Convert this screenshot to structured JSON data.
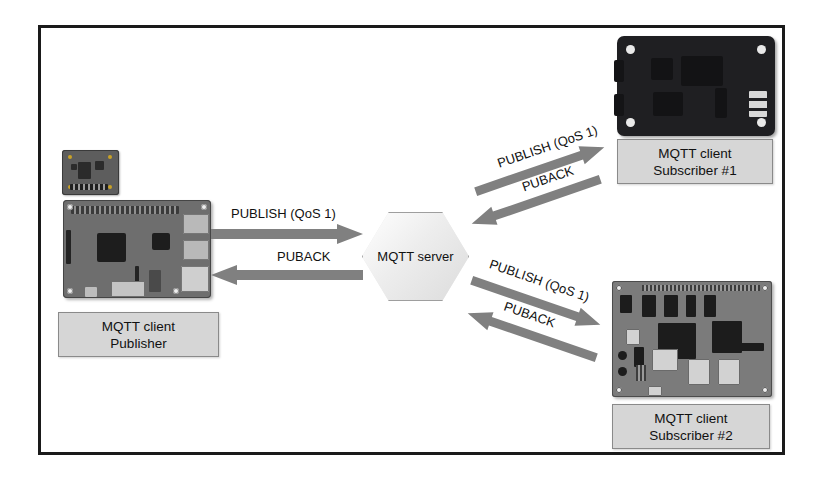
{
  "diagram": {
    "colors": {
      "frame_border": "#1a1a1a",
      "arrow_fill": "#808080",
      "caption_fill": "#d6d6d6",
      "caption_border": "#8a8a8a",
      "hexagon_fill": "#e8e8e8",
      "hexagon_border": "#9e9e9e",
      "background": "#ffffff",
      "text": "#111111"
    },
    "broker": {
      "label": "MQTT server",
      "shape": "hexagon"
    },
    "nodes": [
      {
        "id": "publisher",
        "line1": "MQTT client",
        "line2": "Publisher",
        "device": "raspberry-pi-board",
        "accessory": "sensor-breakout-board"
      },
      {
        "id": "subscriber-1",
        "line1": "MQTT client",
        "line2": "Subscriber #1",
        "device": "dark-single-board-computer"
      },
      {
        "id": "subscriber-2",
        "line1": "MQTT client",
        "line2": "Subscriber #2",
        "device": "gray-development-board"
      }
    ],
    "messages": {
      "publish": "PUBLISH (QoS 1)",
      "puback": "PUBACK"
    },
    "flows": [
      {
        "id": "publisher-to-server",
        "label": "PUBLISH (QoS 1)",
        "direction": "right",
        "from": "publisher",
        "to": "broker"
      },
      {
        "id": "server-to-publisher",
        "label": "PUBACK",
        "direction": "left",
        "from": "broker",
        "to": "publisher"
      },
      {
        "id": "server-to-subscriber-1",
        "label": "PUBLISH (QoS 1)",
        "direction": "up-right",
        "from": "broker",
        "to": "subscriber-1"
      },
      {
        "id": "subscriber-1-to-server",
        "label": "PUBACK",
        "direction": "down-left",
        "from": "subscriber-1",
        "to": "broker"
      },
      {
        "id": "server-to-subscriber-2",
        "label": "PUBLISH (QoS 1)",
        "direction": "down-right",
        "from": "broker",
        "to": "subscriber-2"
      },
      {
        "id": "subscriber-2-to-server",
        "label": "PUBACK",
        "direction": "up-left",
        "from": "subscriber-2",
        "to": "broker"
      }
    ]
  }
}
